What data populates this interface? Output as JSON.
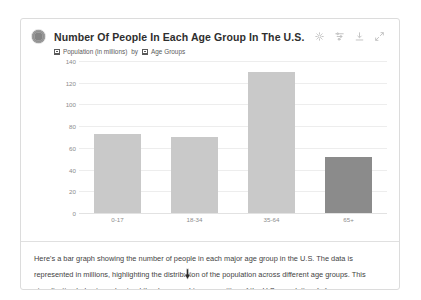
{
  "card": {
    "avatar_name": "assistant-avatar"
  },
  "chart": {
    "title": "Number Of People In Each Age Group In The U.S.",
    "legend": {
      "series_label": "Population (in millions)",
      "connector": "by",
      "category_label": "Age Groups"
    },
    "tools": [
      {
        "name": "insights-icon",
        "label": "Insights"
      },
      {
        "name": "filter-icon",
        "label": "Filter"
      },
      {
        "name": "download-icon",
        "label": "Download"
      },
      {
        "name": "expand-icon",
        "label": "Expand"
      }
    ]
  },
  "chart_data": {
    "type": "bar",
    "title": "Number Of People In Each Age Group In The U.S.",
    "xlabel": "Age Groups",
    "ylabel": "Population (in millions)",
    "categories": [
      "0-17",
      "18-34",
      "35-64",
      "65+"
    ],
    "values": [
      73,
      70,
      130,
      52
    ],
    "series": [
      {
        "name": "Population (in millions)",
        "values": [
          73,
          70,
          130,
          52
        ]
      }
    ],
    "yticks": [
      0,
      20,
      40,
      60,
      80,
      100,
      120,
      140
    ],
    "ylim": [
      0,
      140
    ],
    "grid": true,
    "legend_position": "top-left",
    "bar_color": "#c9c9c9",
    "highlight_color": "#8b8b8b",
    "highlighted_category": "65+"
  },
  "answer": {
    "paragraph": "Here's a bar graph showing the number of people in each major age group in the U.S. The data is represented in millions, highlighting the distribution of the population across different age groups. This visualization helps to understand the demographic composition of the U.S. population.",
    "citation": "[↗]"
  }
}
